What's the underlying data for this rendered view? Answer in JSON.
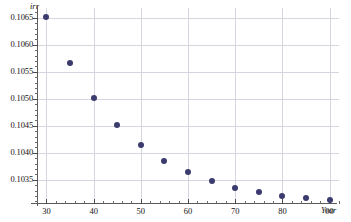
{
  "chart_data": {
    "type": "scatter",
    "title": "",
    "xlabel": "Year",
    "ylabel": "irr",
    "xlim": [
      28,
      92
    ],
    "ylim": [
      0.10305,
      0.10668
    ],
    "grid": true,
    "legend": null,
    "x": [
      30,
      35,
      40,
      45,
      50,
      55,
      60,
      65,
      70,
      75,
      80,
      85,
      90
    ],
    "values": [
      0.10651,
      0.10567,
      0.10502,
      0.10452,
      0.10414,
      0.10385,
      0.10364,
      0.10348,
      0.10335,
      0.10327,
      0.1032,
      0.10316,
      0.10312
    ],
    "point_color": "#3b3b6e",
    "grid_color": "#d6d6e0",
    "axis_color": "#5a5a5a",
    "xticks": [
      30,
      40,
      50,
      60,
      70,
      80,
      90
    ],
    "xtick_labels": [
      "30",
      "40",
      "50",
      "60",
      "70",
      "80",
      "90"
    ],
    "xminor_step": 2,
    "yticks": [
      0.1035,
      0.104,
      0.1045,
      0.105,
      0.1055,
      0.106,
      0.1065
    ],
    "ytick_labels": [
      "0.1035",
      "0.1040",
      "0.1045",
      "0.1050",
      "0.1055",
      "0.1060",
      "0.1065"
    ],
    "yminor_step": 0.0001
  },
  "axis": {
    "y_title": "irr",
    "x_title": "Year"
  }
}
